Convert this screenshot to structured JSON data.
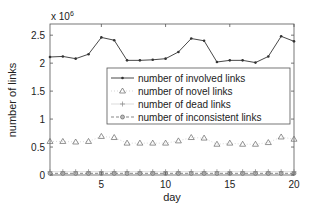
{
  "chart_data": {
    "type": "line",
    "title": "",
    "xlabel": "day",
    "ylabel": "number of links",
    "y_multiplier_label": "x 10",
    "y_multiplier_exponent": "6",
    "xlim": [
      1,
      20
    ],
    "ylim": [
      0,
      2.7
    ],
    "x_ticks": [
      5,
      10,
      15,
      20
    ],
    "y_ticks": [
      0,
      0.5,
      1,
      1.5,
      2,
      2.5
    ],
    "y_tick_labels": [
      "0",
      "0.5",
      "1",
      "1.5",
      "2",
      "2.5"
    ],
    "grid": false,
    "legend_position": "inside-right",
    "x": [
      1,
      2,
      3,
      4,
      5,
      6,
      7,
      8,
      9,
      10,
      11,
      12,
      13,
      14,
      15,
      16,
      17,
      18,
      19,
      20
    ],
    "series": [
      {
        "name": "number of involved links",
        "marker": "dot",
        "line": "solid",
        "color": "#333333",
        "values": [
          2.11,
          2.12,
          2.08,
          2.16,
          2.46,
          2.41,
          2.05,
          2.05,
          2.06,
          2.08,
          2.2,
          2.44,
          2.4,
          2.02,
          2.05,
          2.05,
          2.01,
          2.12,
          2.48,
          2.39
        ]
      },
      {
        "name": "number of novel links",
        "marker": "triangle",
        "line": "dotted",
        "color": "#666666",
        "values": [
          0.6,
          0.6,
          0.59,
          0.6,
          0.69,
          0.67,
          0.57,
          0.57,
          0.57,
          0.57,
          0.61,
          0.67,
          0.66,
          0.55,
          0.57,
          0.55,
          0.55,
          0.58,
          0.68,
          0.64
        ]
      },
      {
        "name": "number of dead links",
        "marker": "plus",
        "line": "solid-light",
        "color": "#888888",
        "values": [
          0.06,
          0.06,
          0.06,
          0.06,
          0.06,
          0.06,
          0.06,
          0.06,
          0.06,
          0.06,
          0.06,
          0.06,
          0.06,
          0.06,
          0.06,
          0.06,
          0.06,
          0.06,
          0.06,
          0.06
        ]
      },
      {
        "name": "number of inconsistent links",
        "marker": "circle",
        "line": "dashed",
        "color": "#555555",
        "values": [
          0.03,
          0.03,
          0.03,
          0.03,
          0.03,
          0.03,
          0.03,
          0.03,
          0.03,
          0.03,
          0.03,
          0.03,
          0.03,
          0.03,
          0.03,
          0.03,
          0.03,
          0.03,
          0.03,
          0.03
        ]
      }
    ]
  }
}
